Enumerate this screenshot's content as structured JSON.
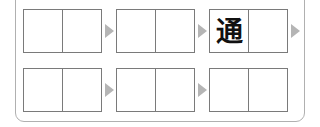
{
  "puzzle": {
    "rows": [
      {
        "groups": [
          {
            "cells": [
              "",
              ""
            ]
          },
          {
            "cells": [
              "",
              ""
            ]
          },
          {
            "cells": [
              "通",
              ""
            ]
          }
        ]
      },
      {
        "groups": [
          {
            "cells": [
              "",
              ""
            ]
          },
          {
            "cells": [
              "",
              ""
            ]
          },
          {
            "cells": [
              "",
              ""
            ]
          }
        ]
      }
    ],
    "colors": {
      "box_border": "#7a7a7a",
      "arrow": "#b5b5b5",
      "panel_border": "#b0b0b0"
    }
  }
}
